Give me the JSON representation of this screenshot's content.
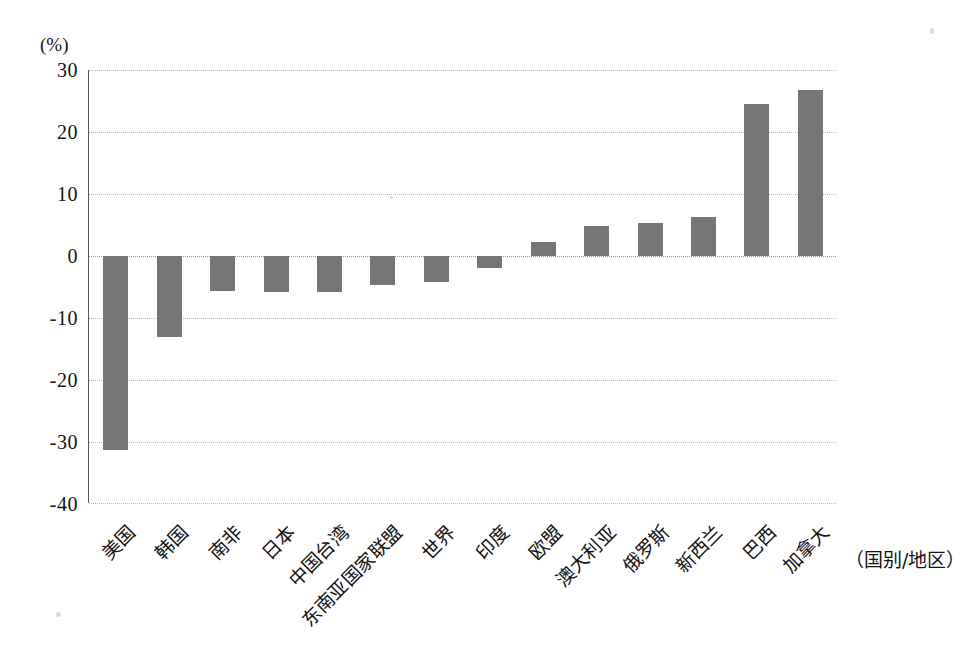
{
  "chart_data": {
    "type": "bar",
    "title": "",
    "subtitle": "",
    "xlabel": "（国别/地区）",
    "ylabel": "(%)",
    "unit": "%",
    "categories": [
      "美国",
      "韩国",
      "南非",
      "日本",
      "中国台湾",
      "东南亚国家联盟",
      "世界",
      "印度",
      "欧盟",
      "澳大利亚",
      "俄罗斯",
      "新西兰",
      "巴西",
      "加拿大"
    ],
    "values": [
      -31.5,
      -13.2,
      -5.8,
      -5.9,
      -5.9,
      -4.8,
      -4.3,
      -2.0,
      2.2,
      4.7,
      5.2,
      6.2,
      24.5,
      26.7
    ],
    "series": [
      {
        "name": "",
        "values": [
          -31.5,
          -13.2,
          -5.8,
          -5.9,
          -5.9,
          -4.8,
          -4.3,
          -2.0,
          2.2,
          4.7,
          5.2,
          6.2,
          24.5,
          26.7
        ]
      }
    ],
    "ylim": [
      -40,
      30
    ],
    "ytick_values": [
      30,
      20,
      10,
      0,
      -10,
      -20,
      -30,
      -40
    ],
    "ytick_labels": [
      "30",
      "20",
      "10",
      "0",
      "-10",
      "-20",
      "-30",
      "-40"
    ],
    "grid": true,
    "grid_axis": "y",
    "legend": false,
    "legend_position": "none",
    "bar_color": "#767676",
    "grid_color": "#b9b9b9",
    "axis_color": "#555555",
    "text_color": "#141414",
    "background": "#ffffff",
    "x_label_rotation": -45
  },
  "axis": {
    "unit_label": "(%)",
    "x_axis_title": "（国别/地区）"
  }
}
